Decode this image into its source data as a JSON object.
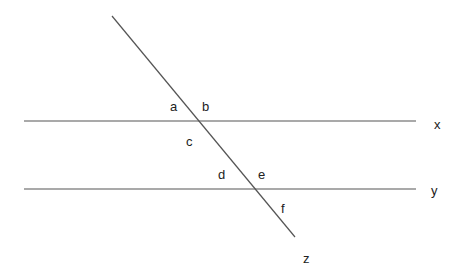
{
  "diagram": {
    "line_color": "#555555",
    "text_color": "#222222",
    "lines": {
      "x": {
        "label": "x",
        "x1": 24,
        "y1": 121,
        "x2": 416,
        "y2": 121
      },
      "y": {
        "label": "y",
        "x1": 24,
        "y1": 189,
        "x2": 416,
        "y2": 189
      },
      "z": {
        "label": "z",
        "x1": 112,
        "y1": 16,
        "x2": 295,
        "y2": 237
      }
    },
    "line_labels": {
      "x": "x",
      "y": "y",
      "z": "z"
    },
    "angle_labels": {
      "a": "a",
      "b": "b",
      "c": "c",
      "d": "d",
      "e": "e",
      "f": "f"
    }
  }
}
